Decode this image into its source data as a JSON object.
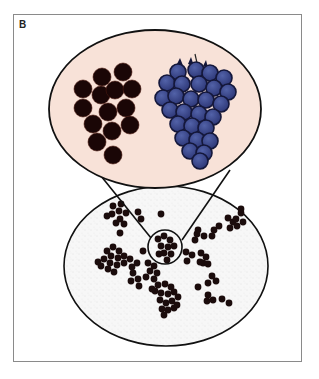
{
  "figure": {
    "panel_label": "B",
    "colors": {
      "frame_border": "#8a8a8a",
      "top_oval_fill": "#f8e2d8",
      "outline": "#111111",
      "black_grape": "#1a0606",
      "blue_grape": "#3b4a8c",
      "blue_grape_dark": "#14173a",
      "lower_oval_fill": "#f7f7f7",
      "dot": "#1b0c0c"
    },
    "top_oval": {
      "cx": 155,
      "cy": 109,
      "rx": 106,
      "ry": 79
    },
    "lower_oval": {
      "cx": 166,
      "cy": 266,
      "rx": 102,
      "ry": 80
    },
    "magnifier_circle": {
      "cx": 165,
      "cy": 247,
      "r": 17
    },
    "zoom_lines": [
      {
        "x1": 101,
        "y1": 176,
        "x2": 151,
        "y2": 238
      },
      {
        "x1": 230,
        "y1": 170,
        "x2": 182,
        "y2": 240
      }
    ],
    "black_grapes": [
      [
        102,
        77
      ],
      [
        123,
        72
      ],
      [
        83,
        89
      ],
      [
        101,
        95
      ],
      [
        115,
        90
      ],
      [
        132,
        89
      ],
      [
        83,
        108
      ],
      [
        108,
        112
      ],
      [
        126,
        108
      ],
      [
        93,
        124
      ],
      [
        130,
        125
      ],
      [
        112,
        131
      ],
      [
        97,
        142
      ],
      [
        113,
        155
      ]
    ],
    "blue_grape_stem": {
      "x1": 195,
      "y1": 54,
      "x2": 199,
      "y2": 72
    },
    "blue_grapes": [
      [
        178,
        72
      ],
      [
        196,
        70
      ],
      [
        210,
        73
      ],
      [
        224,
        78
      ],
      [
        167,
        83
      ],
      [
        182,
        84
      ],
      [
        199,
        84
      ],
      [
        214,
        88
      ],
      [
        228,
        92
      ],
      [
        163,
        98
      ],
      [
        176,
        96
      ],
      [
        191,
        99
      ],
      [
        206,
        100
      ],
      [
        221,
        104
      ],
      [
        170,
        110
      ],
      [
        184,
        112
      ],
      [
        199,
        114
      ],
      [
        213,
        117
      ],
      [
        178,
        124
      ],
      [
        192,
        126
      ],
      [
        206,
        128
      ],
      [
        183,
        138
      ],
      [
        197,
        140
      ],
      [
        210,
        141
      ],
      [
        190,
        151
      ],
      [
        204,
        153
      ],
      [
        200,
        161
      ]
    ],
    "dots": [
      [
        113,
        206
      ],
      [
        119,
        211
      ],
      [
        112,
        214
      ],
      [
        120,
        219
      ],
      [
        126,
        213
      ],
      [
        107,
        216
      ],
      [
        116,
        223
      ],
      [
        124,
        224
      ],
      [
        121,
        204
      ],
      [
        138,
        212
      ],
      [
        141,
        219
      ],
      [
        161,
        214
      ],
      [
        120,
        233
      ],
      [
        143,
        251
      ],
      [
        107,
        251
      ],
      [
        113,
        247
      ],
      [
        119,
        251
      ],
      [
        111,
        256
      ],
      [
        118,
        258
      ],
      [
        124,
        256
      ],
      [
        104,
        259
      ],
      [
        110,
        263
      ],
      [
        117,
        265
      ],
      [
        124,
        263
      ],
      [
        130,
        259
      ],
      [
        101,
        266
      ],
      [
        108,
        269
      ],
      [
        114,
        272
      ],
      [
        98,
        262
      ],
      [
        132,
        267
      ],
      [
        137,
        263
      ],
      [
        133,
        273
      ],
      [
        138,
        279
      ],
      [
        131,
        281
      ],
      [
        139,
        286
      ],
      [
        148,
        263
      ],
      [
        154,
        266
      ],
      [
        150,
        271
      ],
      [
        157,
        273
      ],
      [
        154,
        279
      ],
      [
        146,
        277
      ],
      [
        158,
        239
      ],
      [
        164,
        236
      ],
      [
        170,
        240
      ],
      [
        161,
        246
      ],
      [
        168,
        247
      ],
      [
        174,
        246
      ],
      [
        164,
        253
      ],
      [
        171,
        254
      ],
      [
        167,
        260
      ],
      [
        159,
        254
      ],
      [
        186,
        252
      ],
      [
        192,
        255
      ],
      [
        187,
        261
      ],
      [
        201,
        253
      ],
      [
        206,
        257
      ],
      [
        203,
        263
      ],
      [
        208,
        264
      ],
      [
        200,
        262
      ],
      [
        198,
        230
      ],
      [
        204,
        236
      ],
      [
        195,
        240
      ],
      [
        214,
        230
      ],
      [
        219,
        226
      ],
      [
        212,
        236
      ],
      [
        228,
        218
      ],
      [
        233,
        222
      ],
      [
        230,
        228
      ],
      [
        237,
        226
      ],
      [
        236,
        219
      ],
      [
        243,
        222
      ],
      [
        241,
        213
      ],
      [
        241,
        209
      ],
      [
        212,
        276
      ],
      [
        216,
        281
      ],
      [
        208,
        283
      ],
      [
        158,
        285
      ],
      [
        165,
        284
      ],
      [
        171,
        287
      ],
      [
        155,
        291
      ],
      [
        161,
        293
      ],
      [
        168,
        294
      ],
      [
        174,
        292
      ],
      [
        160,
        300
      ],
      [
        166,
        303
      ],
      [
        172,
        301
      ],
      [
        178,
        297
      ],
      [
        162,
        309
      ],
      [
        168,
        310
      ],
      [
        174,
        308
      ],
      [
        164,
        315
      ],
      [
        152,
        289
      ],
      [
        177,
        305
      ],
      [
        198,
        287
      ],
      [
        208,
        295
      ],
      [
        213,
        300
      ],
      [
        207,
        301
      ],
      [
        222,
        299
      ],
      [
        229,
        303
      ],
      [
        197,
        234
      ]
    ]
  }
}
